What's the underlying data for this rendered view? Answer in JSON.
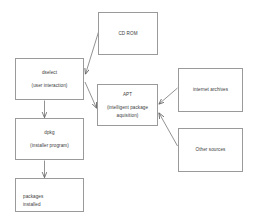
{
  "diagram": {
    "type": "flowchart",
    "canvas": {
      "width": 253,
      "height": 224,
      "background": "#ffffff"
    },
    "style": {
      "box_border": "#9a9a9a",
      "box_fill": "#ffffff",
      "text": "#3a3a3a",
      "edge": "#6d6d6d"
    },
    "nodes": [
      {
        "id": "cdrom",
        "primary": "CD ROM",
        "secondary": "",
        "x": 98,
        "y": 12,
        "w": 60,
        "h": 43
      },
      {
        "id": "dselect",
        "primary": "dselect",
        "secondary": "(user interaction)",
        "x": 15,
        "y": 58,
        "w": 69,
        "h": 42
      },
      {
        "id": "apt",
        "primary": "APT",
        "secondary": "(intelligent package aquisition)",
        "x": 97,
        "y": 84,
        "w": 61,
        "h": 42
      },
      {
        "id": "internet-archives",
        "primary": "internet archives",
        "secondary": "",
        "x": 178,
        "y": 68,
        "w": 65,
        "h": 44
      },
      {
        "id": "other-sources",
        "primary": "Other sources",
        "secondary": "",
        "x": 178,
        "y": 128,
        "w": 65,
        "h": 44
      },
      {
        "id": "dpkg",
        "primary": "dpkg",
        "secondary": "(installer program)",
        "x": 15,
        "y": 118,
        "w": 69,
        "h": 42
      },
      {
        "id": "packages",
        "primary": "packages",
        "secondary": "installed",
        "x": 15,
        "y": 178,
        "w": 69,
        "h": 34
      }
    ],
    "edges": [
      {
        "id": "cdrom-to-dselect",
        "from": "cdrom",
        "to": "dselect",
        "arrow": "to"
      },
      {
        "id": "dselect-to-apt",
        "from": "dselect",
        "to": "apt",
        "arrow": "to"
      },
      {
        "id": "internet-archives-to-apt",
        "from": "internet-archives",
        "to": "apt",
        "arrow": "to"
      },
      {
        "id": "other-sources-to-apt",
        "from": "other-sources",
        "to": "apt",
        "arrow": "to"
      },
      {
        "id": "dselect-to-dpkg",
        "from": "dselect",
        "to": "dpkg",
        "arrow": "to"
      },
      {
        "id": "dpkg-to-packages",
        "from": "dpkg",
        "to": "packages",
        "arrow": "to"
      }
    ]
  }
}
